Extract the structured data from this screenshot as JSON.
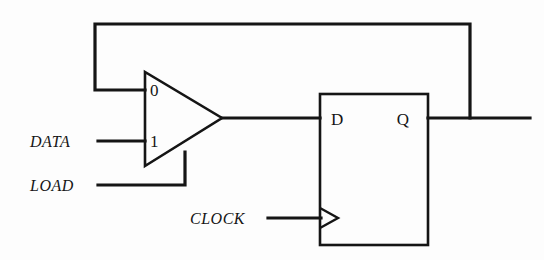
{
  "diagram": {
    "background_color": "#fdfdfd",
    "line_color": "#151515"
  },
  "signals": {
    "data": "DATA",
    "load": "LOAD",
    "clock": "CLOCK"
  },
  "mux": {
    "input_0": "0",
    "input_1": "1"
  },
  "flipflop": {
    "d_port": "D",
    "q_port": "Q"
  }
}
